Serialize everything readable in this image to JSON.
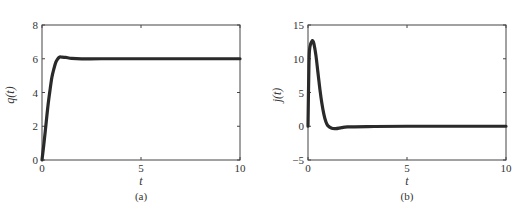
{
  "chart_data": [
    {
      "type": "line",
      "panel": "(a)",
      "title": "",
      "xlabel": "t",
      "ylabel": "q(t)",
      "xlim": [
        0,
        10
      ],
      "ylim": [
        0,
        8
      ],
      "xticks": [
        0,
        5,
        10
      ],
      "yticks": [
        0,
        2,
        4,
        6,
        8
      ],
      "grid": false,
      "series": [
        {
          "name": "q(t)",
          "color": "#2a2a2a",
          "x": [
            0,
            0.1,
            0.2,
            0.3,
            0.4,
            0.5,
            0.6,
            0.7,
            0.8,
            0.9,
            1.0,
            1.2,
            1.5,
            2.0,
            3.0,
            5.0,
            10.0
          ],
          "y": [
            0,
            1.0,
            2.1,
            3.2,
            4.1,
            4.9,
            5.4,
            5.8,
            6.0,
            6.1,
            6.1,
            6.08,
            6.02,
            5.99,
            6.0,
            6.0,
            6.0
          ]
        }
      ]
    },
    {
      "type": "line",
      "panel": "(b)",
      "title": "",
      "xlabel": "t",
      "ylabel": "j(t)",
      "xlim": [
        0,
        10
      ],
      "ylim": [
        -5,
        15
      ],
      "xticks": [
        0,
        5,
        10
      ],
      "yticks": [
        -5,
        0,
        5,
        10,
        15
      ],
      "grid": false,
      "series": [
        {
          "name": "j(t)",
          "color": "#2a2a2a",
          "x": [
            0,
            0.05,
            0.1,
            0.2,
            0.25,
            0.3,
            0.4,
            0.5,
            0.6,
            0.7,
            0.8,
            0.9,
            1.0,
            1.2,
            1.4,
            1.7,
            2.0,
            3.0,
            5.0,
            10.0
          ],
          "y": [
            0,
            9.5,
            11.8,
            12.6,
            12.6,
            12.2,
            10.5,
            8.0,
            5.5,
            3.4,
            1.8,
            0.7,
            0.1,
            -0.3,
            -0.35,
            -0.2,
            -0.1,
            -0.05,
            0,
            0
          ]
        }
      ]
    }
  ],
  "panels": {
    "a": {
      "caption": "(a)",
      "xlabel": "t",
      "ylabel": "q(t)"
    },
    "b": {
      "caption": "(b)",
      "xlabel": "t",
      "ylabel": "j(t)"
    }
  }
}
